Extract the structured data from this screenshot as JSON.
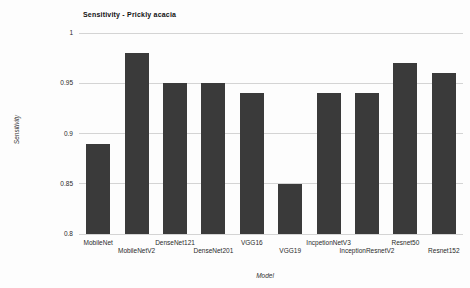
{
  "chart_data": {
    "type": "bar",
    "title": "Sensitivity - Prickly acacia",
    "xlabel": "Model",
    "ylabel": "Sensitivity",
    "categories": [
      "MobileNet",
      "MobileNetV2",
      "DenseNet121",
      "DenseNet201",
      "VGG16",
      "VGG19",
      "IncpetionNetV3",
      "InceptionResnetV2",
      "Resnet50",
      "Resnet152"
    ],
    "values": [
      0.89,
      0.98,
      0.95,
      0.95,
      0.94,
      0.85,
      0.94,
      0.94,
      0.97,
      0.96
    ],
    "ylim": [
      0.8,
      1.0
    ],
    "yticks": [
      0.8,
      0.85,
      0.9,
      0.95,
      1
    ],
    "ytick_labels": [
      "0.8",
      "0.85",
      "0.9",
      "0.95",
      "1"
    ],
    "grid": "horizontal",
    "legend": "none",
    "bar_color": "#3a3a3a",
    "grid_color": "#d4d4d4",
    "xtick_label_rows": "staggered"
  }
}
